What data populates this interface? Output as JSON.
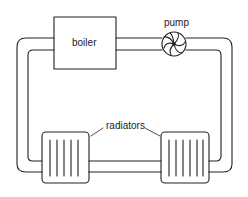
{
  "diagram": {
    "labels": {
      "boiler": "boiler",
      "pump": "pump",
      "radiators": "radiators"
    },
    "components": [
      "boiler",
      "pump",
      "radiator-left",
      "radiator-right",
      "pipe-loop"
    ],
    "colors": {
      "line": "#222222",
      "background": "#ffffff"
    }
  }
}
